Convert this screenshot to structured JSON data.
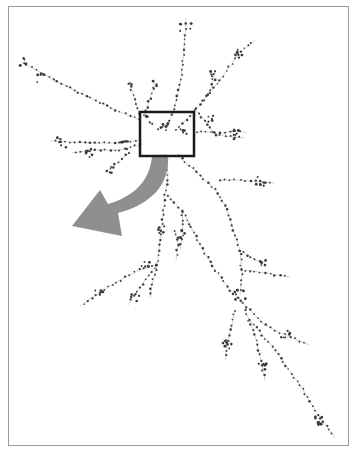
{
  "figure": {
    "colors": {
      "frame": "#9a9a9a",
      "edge": "#d4d4d4",
      "node": "#3a3a3a",
      "highlight_box": "#1a1a1a",
      "arrow": "#8f8f8f"
    },
    "highlight_box": {
      "x": 140,
      "y": 112,
      "width": 54,
      "height": 44
    },
    "arrow": {
      "path": "M168,156 C170,185 150,205 118,213 L122,236 L72,226 L100,190 L108,204 C135,196 150,180 152,156 Z"
    }
  },
  "graph": {
    "branches": [
      {
        "name": "top-vertical",
        "points": [
          [
            166,
            130
          ],
          [
            174,
            110
          ],
          [
            180,
            85
          ],
          [
            183,
            60
          ],
          [
            185,
            35
          ],
          [
            186,
            18
          ]
        ]
      },
      {
        "name": "upper-right-long",
        "points": [
          [
            176,
            130
          ],
          [
            200,
            105
          ],
          [
            220,
            80
          ],
          [
            238,
            55
          ],
          [
            255,
            40
          ]
        ]
      },
      {
        "name": "upper-right-mid",
        "points": [
          [
            205,
            100
          ],
          [
            212,
            85
          ],
          [
            215,
            70
          ]
        ]
      },
      {
        "name": "upper-mid-right",
        "points": [
          [
            195,
            110
          ],
          [
            205,
            120
          ],
          [
            215,
            135
          ],
          [
            235,
            130
          ],
          [
            247,
            133
          ]
        ]
      },
      {
        "name": "right-horizontal",
        "points": [
          [
            196,
            132
          ],
          [
            210,
            132
          ],
          [
            225,
            136
          ],
          [
            245,
            138
          ]
        ]
      },
      {
        "name": "upper-left-long",
        "points": [
          [
            140,
            120
          ],
          [
            120,
            112
          ],
          [
            95,
            100
          ],
          [
            70,
            88
          ],
          [
            45,
            75
          ],
          [
            22,
            62
          ]
        ]
      },
      {
        "name": "upper-left-short",
        "points": [
          [
            140,
            118
          ],
          [
            135,
            100
          ],
          [
            130,
            85
          ]
        ]
      },
      {
        "name": "upper-left-mid",
        "points": [
          [
            145,
            115
          ],
          [
            150,
            98
          ],
          [
            155,
            82
          ]
        ]
      },
      {
        "name": "left-horizontal",
        "points": [
          [
            140,
            140
          ],
          [
            120,
            143
          ],
          [
            95,
            143
          ],
          [
            70,
            142
          ],
          [
            50,
            141
          ]
        ]
      },
      {
        "name": "left-lower-horizontal",
        "points": [
          [
            140,
            145
          ],
          [
            120,
            150
          ],
          [
            95,
            150
          ],
          [
            72,
            153
          ]
        ]
      },
      {
        "name": "mid-left-short",
        "points": [
          [
            130,
            152
          ],
          [
            115,
            165
          ],
          [
            105,
            172
          ]
        ]
      },
      {
        "name": "center-down",
        "points": [
          [
            166,
            156
          ],
          [
            168,
            175
          ],
          [
            165,
            195
          ],
          [
            163,
            215
          ],
          [
            160,
            240
          ],
          [
            157,
            265
          ]
        ]
      },
      {
        "name": "left-down-long",
        "points": [
          [
            157,
            265
          ],
          [
            140,
            270
          ],
          [
            120,
            280
          ],
          [
            100,
            292
          ],
          [
            80,
            306
          ]
        ]
      },
      {
        "name": "left-down-mid",
        "points": [
          [
            157,
            265
          ],
          [
            145,
            280
          ],
          [
            135,
            295
          ],
          [
            128,
            305
          ]
        ]
      },
      {
        "name": "left-down-short",
        "points": [
          [
            157,
            265
          ],
          [
            152,
            285
          ],
          [
            150,
            298
          ]
        ]
      },
      {
        "name": "center-right-down",
        "points": [
          [
            178,
            156
          ],
          [
            200,
            175
          ],
          [
            215,
            190
          ],
          [
            225,
            205
          ],
          [
            232,
            225
          ],
          [
            240,
            250
          ],
          [
            242,
            275
          ],
          [
            240,
            295
          ]
        ]
      },
      {
        "name": "right-branch-mid",
        "points": [
          [
            220,
            180
          ],
          [
            240,
            180
          ],
          [
            260,
            182
          ],
          [
            275,
            183
          ]
        ]
      },
      {
        "name": "right-branch-low",
        "points": [
          [
            240,
            250
          ],
          [
            255,
            260
          ],
          [
            265,
            262
          ]
        ]
      },
      {
        "name": "right-branch-lower",
        "points": [
          [
            245,
            270
          ],
          [
            265,
            273
          ],
          [
            290,
            277
          ]
        ]
      },
      {
        "name": "center-long-down",
        "points": [
          [
            168,
            195
          ],
          [
            185,
            215
          ],
          [
            200,
            245
          ],
          [
            215,
            270
          ],
          [
            230,
            290
          ],
          [
            240,
            300
          ]
        ]
      },
      {
        "name": "mid-down-branch",
        "points": [
          [
            182,
            210
          ],
          [
            183,
            225
          ],
          [
            182,
            240
          ],
          [
            180,
            250
          ]
        ]
      },
      {
        "name": "mid-down-branch2",
        "points": [
          [
            175,
            230
          ],
          [
            178,
            245
          ],
          [
            176,
            260
          ]
        ]
      },
      {
        "name": "lower-cluster",
        "points": [
          [
            240,
            300
          ],
          [
            250,
            310
          ],
          [
            265,
            325
          ],
          [
            285,
            335
          ],
          [
            310,
            345
          ]
        ]
      },
      {
        "name": "lower-mid",
        "points": [
          [
            235,
            310
          ],
          [
            232,
            325
          ],
          [
            228,
            340
          ],
          [
            225,
            360
          ]
        ]
      },
      {
        "name": "lower-long",
        "points": [
          [
            245,
            310
          ],
          [
            255,
            335
          ],
          [
            262,
            365
          ],
          [
            265,
            380
          ]
        ]
      },
      {
        "name": "lower-diagonal",
        "points": [
          [
            250,
            320
          ],
          [
            275,
            350
          ],
          [
            300,
            385
          ],
          [
            318,
            415
          ],
          [
            335,
            438
          ]
        ]
      }
    ],
    "node_clusters": [
      {
        "cx": 22,
        "cy": 62,
        "n": 6,
        "spread": 4
      },
      {
        "cx": 40,
        "cy": 78,
        "n": 5,
        "spread": 5
      },
      {
        "cx": 130,
        "cy": 85,
        "n": 4,
        "spread": 4
      },
      {
        "cx": 155,
        "cy": 85,
        "n": 4,
        "spread": 4
      },
      {
        "cx": 186,
        "cy": 25,
        "n": 6,
        "spread": 6
      },
      {
        "cx": 240,
        "cy": 55,
        "n": 7,
        "spread": 6
      },
      {
        "cx": 212,
        "cy": 75,
        "n": 5,
        "spread": 5
      },
      {
        "cx": 212,
        "cy": 120,
        "n": 5,
        "spread": 5
      },
      {
        "cx": 235,
        "cy": 134,
        "n": 7,
        "spread": 6
      },
      {
        "cx": 60,
        "cy": 142,
        "n": 6,
        "spread": 6
      },
      {
        "cx": 90,
        "cy": 152,
        "n": 6,
        "spread": 5
      },
      {
        "cx": 125,
        "cy": 145,
        "n": 6,
        "spread": 4
      },
      {
        "cx": 110,
        "cy": 170,
        "n": 5,
        "spread": 4
      },
      {
        "cx": 163,
        "cy": 128,
        "n": 8,
        "spread": 5
      },
      {
        "cx": 150,
        "cy": 120,
        "n": 5,
        "spread": 4
      },
      {
        "cx": 183,
        "cy": 130,
        "n": 5,
        "spread": 4
      },
      {
        "cx": 260,
        "cy": 182,
        "n": 6,
        "spread": 5
      },
      {
        "cx": 162,
        "cy": 230,
        "n": 5,
        "spread": 4
      },
      {
        "cx": 182,
        "cy": 235,
        "n": 5,
        "spread": 5
      },
      {
        "cx": 145,
        "cy": 265,
        "n": 6,
        "spread": 5
      },
      {
        "cx": 100,
        "cy": 292,
        "n": 5,
        "spread": 5
      },
      {
        "cx": 135,
        "cy": 298,
        "n": 5,
        "spread": 4
      },
      {
        "cx": 262,
        "cy": 262,
        "n": 5,
        "spread": 4
      },
      {
        "cx": 240,
        "cy": 295,
        "n": 8,
        "spread": 6
      },
      {
        "cx": 285,
        "cy": 333,
        "n": 6,
        "spread": 5
      },
      {
        "cx": 228,
        "cy": 345,
        "n": 7,
        "spread": 5
      },
      {
        "cx": 262,
        "cy": 368,
        "n": 6,
        "spread": 5
      },
      {
        "cx": 320,
        "cy": 420,
        "n": 9,
        "spread": 5
      }
    ]
  }
}
